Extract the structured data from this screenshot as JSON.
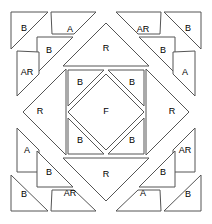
{
  "diagram": {
    "canvas": {
      "width": 212,
      "height": 224
    },
    "block_bounds": {
      "x": 10,
      "y": 11,
      "width": 192,
      "height": 201
    },
    "colors": {
      "background": "#ffffff",
      "piece_fill": "#ffffff",
      "piece_stroke": "#555555",
      "label_text": "#000000"
    },
    "labels": {
      "A": "A",
      "AR": "AR",
      "B": "B",
      "F": "F",
      "R": "R"
    },
    "pieces": [
      {
        "id": "corner-tl-b",
        "label": "B",
        "label_x": 24,
        "label_y": 29,
        "points": "11,12 48,12 11,49"
      },
      {
        "id": "strip-top-left-a",
        "label": "A",
        "label_x": 70,
        "label_y": 30,
        "points": "51,12 96,12 74,34 52,34"
      },
      {
        "id": "inner-tl-b",
        "label": "B",
        "label_x": 49,
        "label_y": 51,
        "points": "37,37 73,37 37,73"
      },
      {
        "id": "strip-left-top-ar",
        "label": "AR",
        "label_x": 27,
        "label_y": 73,
        "points": "17,51 17,96 39,74 39,52"
      },
      {
        "id": "tri-top-r",
        "label": "R",
        "label_x": 106,
        "label_y": 49,
        "points": "106,23 149,66 63,66"
      },
      {
        "id": "strip-top-right-ar",
        "label": "AR",
        "label_x": 143,
        "label_y": 30,
        "points": "116,12 161,12 160,34 138,34"
      },
      {
        "id": "corner-tr-b",
        "label": "B",
        "label_x": 188,
        "label_y": 29,
        "points": "164,12 201,12 201,49"
      },
      {
        "id": "inner-tr-b",
        "label": "B",
        "label_x": 163,
        "label_y": 51,
        "points": "139,37 175,37 175,73"
      },
      {
        "id": "strip-right-top-a",
        "label": "A",
        "label_x": 185,
        "label_y": 73,
        "points": "173,52 173,74 195,96 195,51"
      },
      {
        "id": "tri-left-r",
        "label": "R",
        "label_x": 40,
        "label_y": 112,
        "points": "23,112 66,69 66,155"
      },
      {
        "id": "tri-right-r",
        "label": "R",
        "label_x": 172,
        "label_y": 112,
        "points": "189,112 146,69 146,155"
      },
      {
        "id": "center-tl-b",
        "label": "B",
        "label_x": 80,
        "label_y": 83,
        "points": "68,70 104,70 68,106"
      },
      {
        "id": "center-tr-b",
        "label": "B",
        "label_x": 132,
        "label_y": 83,
        "points": "108,70 144,70 144,106"
      },
      {
        "id": "center-f",
        "label": "F",
        "label_x": 106,
        "label_y": 112,
        "points": "106,74 144,112 106,150 68,112"
      },
      {
        "id": "center-bl-b",
        "label": "B",
        "label_x": 80,
        "label_y": 141,
        "points": "68,118 68,154 104,154"
      },
      {
        "id": "center-br-b",
        "label": "B",
        "label_x": 132,
        "label_y": 141,
        "points": "144,118 144,154 108,154"
      },
      {
        "id": "strip-left-bottom-a",
        "label": "A",
        "label_x": 27,
        "label_y": 151,
        "points": "17,128 39,150 39,172 17,172"
      },
      {
        "id": "inner-bl-b",
        "label": "B",
        "label_x": 49,
        "label_y": 173,
        "points": "37,151 73,187 37,187"
      },
      {
        "id": "corner-bl-b",
        "label": "B",
        "label_x": 24,
        "label_y": 195,
        "points": "11,175 11,211 48,211"
      },
      {
        "id": "strip-bottom-left-ar",
        "label": "AR",
        "label_x": 70,
        "label_y": 194,
        "points": "52,190 74,190 96,211 51,211"
      },
      {
        "id": "tri-bottom-r",
        "label": "R",
        "label_x": 106,
        "label_y": 175,
        "points": "63,158 149,158 106,201"
      },
      {
        "id": "strip-right-bottom-ar",
        "label": "AR",
        "label_x": 185,
        "label_y": 151,
        "points": "195,128 195,172 173,172 173,150"
      },
      {
        "id": "inner-br-b",
        "label": "B",
        "label_x": 163,
        "label_y": 173,
        "points": "175,151 175,187 139,187"
      },
      {
        "id": "strip-bottom-right-a",
        "label": "A",
        "label_x": 143,
        "label_y": 194,
        "points": "138,190 160,190 161,211 116,211"
      },
      {
        "id": "corner-br-b",
        "label": "B",
        "label_x": 188,
        "label_y": 195,
        "points": "201,175 201,211 164,211"
      }
    ]
  }
}
